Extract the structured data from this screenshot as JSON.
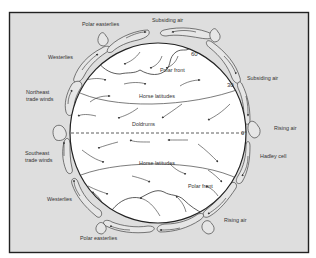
{
  "figure": {
    "type": "atmospheric-circulation-diagram",
    "colors": {
      "background": "#dedede",
      "globe": "#ffffff",
      "frame": "#222222",
      "lines": "#333333"
    }
  },
  "labels": {
    "top_left": "Polar easterlies",
    "top_center": "Subsiding air",
    "north_westerlies": "Westerlies",
    "northeast_trades_1": "Northeast",
    "northeast_trades_2": "trade winds",
    "right_upper": "Subsiding air",
    "right_equator": "Rising air",
    "right_hadley": "Hadley cell",
    "southeast_trades_1": "Southeast",
    "southeast_trades_2": "trade winds",
    "south_westerlies": "Westerlies",
    "bottom_right": "Rising air",
    "bottom_left": "Polar easterlies"
  },
  "globe_labels": {
    "polar_front_north": "Polar front",
    "horse_latitudes_north": "Horse latitudes",
    "doldrums": "Doldrums",
    "horse_latitudes_south": "Horse latitudes",
    "polar_front_south": "Polar front"
  },
  "latitudes": {
    "lat60": "60",
    "lat30": "30",
    "lat0": "0°"
  }
}
